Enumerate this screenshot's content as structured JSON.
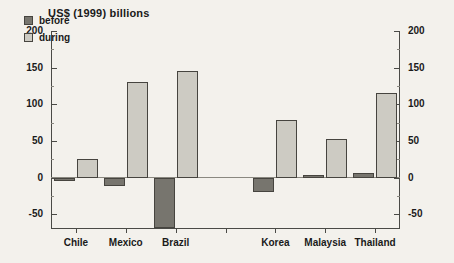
{
  "chart_data": {
    "type": "bar",
    "title": "US$ (1999) billions",
    "xlabel": "",
    "ylabel": "US$ (1999) billions",
    "ylim": [
      -70,
      200
    ],
    "ytick_values": [
      200,
      150,
      100,
      50,
      0,
      -50
    ],
    "ytick_labels": [
      "200",
      "150",
      "100",
      "50",
      "0",
      "-50"
    ],
    "yminor_step": 25,
    "grid": false,
    "legend_position": "top-left",
    "dual_axis": true,
    "right_axis_labels": [
      "200",
      "150",
      "100",
      "50",
      "0",
      "-50"
    ],
    "categories": [
      "Chile",
      "Mexico",
      "Brazil",
      "",
      "Korea",
      "Malaysia",
      "Thailand"
    ],
    "series": [
      {
        "name": "before",
        "color": "#77756e",
        "values": [
          -5,
          -11,
          -69,
          null,
          -19,
          3,
          6
        ]
      },
      {
        "name": "during",
        "color": "#cdcbc3",
        "values": [
          26,
          131,
          145,
          null,
          79,
          53,
          116
        ]
      }
    ]
  },
  "legend": {
    "items": [
      {
        "label": "before",
        "swatch": "before"
      },
      {
        "label": "during",
        "swatch": "during"
      }
    ]
  },
  "colors": {
    "before": "#77756e",
    "during": "#cdcbc3",
    "axis": "#4a4a46",
    "background": "#f3f1ec",
    "text": "#1a1a1a"
  }
}
